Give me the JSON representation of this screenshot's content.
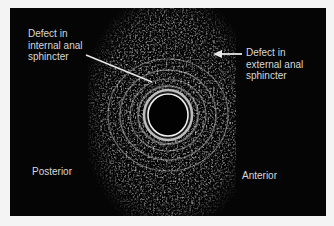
{
  "figure": {
    "labels": {
      "internal_defect": "Defect in\ninternal anal\nsphincter",
      "external_defect": "Defect in\nexternal anal\nsphincter",
      "posterior": "Posterior",
      "anterior": "Anterior"
    },
    "colors": {
      "background": "#050505",
      "text": "#d8d8d8",
      "page": "#f4f4f4"
    }
  }
}
